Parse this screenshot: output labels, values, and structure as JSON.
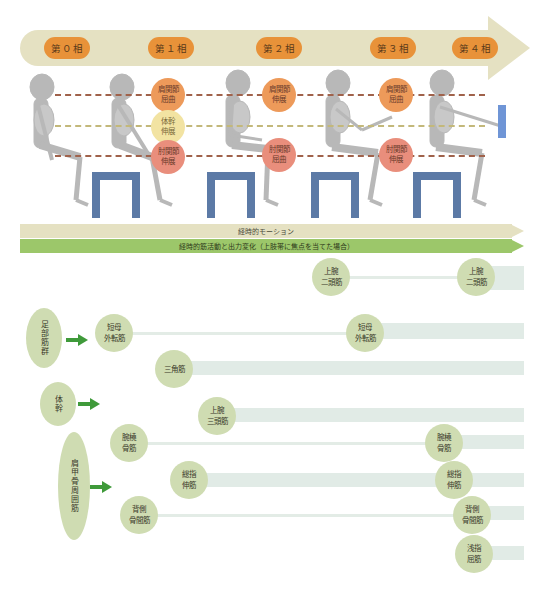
{
  "phases": {
    "labels": [
      "第０相",
      "第１相",
      "第２相",
      "第３相",
      "第４相"
    ],
    "colors": {
      "arrow": "#e5e1c2",
      "pill": "#e89239"
    }
  },
  "joint_markers": {
    "phase1": {
      "shoulder": [
        "肩関節",
        "屈曲"
      ],
      "trunk": [
        "体幹",
        "伸展"
      ],
      "elbow": [
        "肘関節",
        "伸展"
      ]
    },
    "phase2": {
      "shoulder": [
        "肩関節",
        "伸展"
      ],
      "elbow": [
        "肘関節",
        "屈曲"
      ]
    },
    "phase3": {
      "shoulder": [
        "肩関節",
        "屈曲"
      ],
      "elbow": [
        "肘関節",
        "伸展"
      ]
    },
    "colors": {
      "shoulder": "#ed9a5a",
      "trunk": "#f2e3a2",
      "elbow": "#e98e7c",
      "stool": "#5c7aa6"
    }
  },
  "timeline": {
    "motion_label": "経時的モーション",
    "muscle_label": "経時的筋活動と出力変化（上肢帯に焦点を当てた場合）"
  },
  "muscle_groups": {
    "foot": "足部筋群",
    "trunk": "体幹",
    "scapula": "肩甲骨周囲筋"
  },
  "muscles": {
    "biceps_start": [
      "上腕",
      "二頭筋"
    ],
    "biceps_end": [
      "上腕",
      "二頭筋"
    ],
    "apb_start": [
      "短母",
      "外転筋"
    ],
    "apb_mid": [
      "短母",
      "外転筋"
    ],
    "deltoid": [
      "三角筋"
    ],
    "triceps": [
      "上腕",
      "三頭筋"
    ],
    "brachioradialis_start": [
      "腕橈",
      "骨筋"
    ],
    "brachioradialis_end": [
      "腕橈",
      "骨筋"
    ],
    "edc_start": [
      "総指",
      "伸筋"
    ],
    "edc_end": [
      "総指",
      "伸筋"
    ],
    "dorsal_int_start": [
      "背側",
      "骨間筋"
    ],
    "dorsal_int_end": [
      "背側",
      "骨間筋"
    ],
    "fds": [
      "浅指",
      "屈筋"
    ]
  }
}
